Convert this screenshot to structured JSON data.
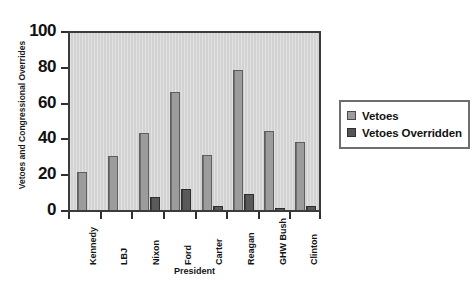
{
  "chart_data": {
    "type": "bar",
    "title": "",
    "xlabel": "President",
    "ylabel": "Vetoes and Congressional Overrides",
    "categories": [
      "Kennedy",
      "LBJ",
      "Nixon",
      "Ford",
      "Carter",
      "Reagan",
      "GHW Bush",
      "Clinton"
    ],
    "series": [
      {
        "name": "Vetoes",
        "values": [
          21,
          30,
          43,
          66,
          31,
          78,
          44,
          38
        ],
        "color": "#9c9c9c"
      },
      {
        "name": "Vetoes Overridden",
        "values": [
          0,
          0,
          7,
          12,
          2,
          9,
          1,
          2
        ],
        "color": "#555555"
      }
    ],
    "ylim": [
      0,
      100
    ],
    "yticks": [
      0,
      20,
      40,
      60,
      80,
      100
    ],
    "ytick_labels": [
      "0",
      "20",
      "40",
      "60",
      "80",
      "100"
    ],
    "grid": false,
    "legend_position": "right",
    "plot_background": "#d5d5d5",
    "frame_color": "#3b3b3b"
  },
  "legend": {
    "entries": [
      {
        "label": "Vetoes"
      },
      {
        "label": "Vetoes Overridden"
      }
    ]
  }
}
